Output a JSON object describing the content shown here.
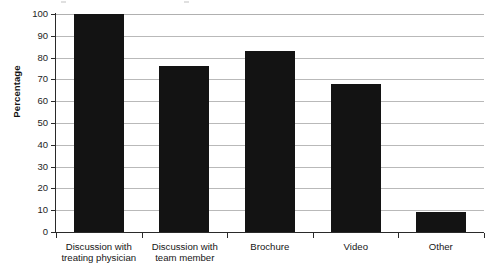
{
  "chart_data": {
    "type": "bar",
    "title": "",
    "xlabel": "",
    "ylabel": "Percentage",
    "ylim": [
      0,
      100
    ],
    "ytick_step": 10,
    "yticks": [
      100,
      90,
      80,
      70,
      60,
      50,
      40,
      30,
      20,
      10,
      0
    ],
    "grid": true,
    "legend": false,
    "bar_color": "#131313",
    "grid_color": "#b9b9b9",
    "axis_color": "#2a2a2a",
    "categories": [
      "Discussion with treating physician",
      "Discussion with team member",
      "Brochure",
      "Video",
      "Other"
    ],
    "category_lines": [
      [
        "Discussion with",
        "treating physician"
      ],
      [
        "Discussion with",
        "team member"
      ],
      [
        "Brochure"
      ],
      [
        "Video"
      ],
      [
        "Other"
      ]
    ],
    "values": [
      100,
      76,
      83,
      68,
      9
    ]
  }
}
